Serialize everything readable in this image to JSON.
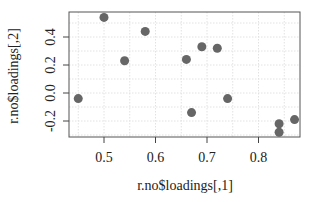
{
  "chart_data": {
    "type": "scatter",
    "title": "",
    "xlabel": "r.no$loadings[,1]",
    "ylabel": "r.no$loadings[,2]",
    "xlim": [
      0.44,
      0.885
    ],
    "ylim": [
      -0.315,
      0.575
    ],
    "xticks": [
      0.5,
      0.6,
      0.7,
      0.8
    ],
    "xtick_labels": [
      "0.5",
      "0.6",
      "0.7",
      "0.8"
    ],
    "yticks": [
      -0.2,
      0.0,
      0.2,
      0.4
    ],
    "ytick_labels": [
      "-0.2",
      "0.0",
      "0.2",
      "0.4"
    ],
    "grid": true,
    "legend": null,
    "point_color": "#666666",
    "points": [
      {
        "x": 0.45,
        "y": -0.04
      },
      {
        "x": 0.5,
        "y": 0.54
      },
      {
        "x": 0.54,
        "y": 0.23
      },
      {
        "x": 0.58,
        "y": 0.44
      },
      {
        "x": 0.66,
        "y": 0.24
      },
      {
        "x": 0.69,
        "y": 0.33
      },
      {
        "x": 0.72,
        "y": 0.32
      },
      {
        "x": 0.67,
        "y": -0.14
      },
      {
        "x": 0.74,
        "y": -0.04
      },
      {
        "x": 0.84,
        "y": -0.22
      },
      {
        "x": 0.84,
        "y": -0.28
      },
      {
        "x": 0.87,
        "y": -0.19
      }
    ]
  }
}
